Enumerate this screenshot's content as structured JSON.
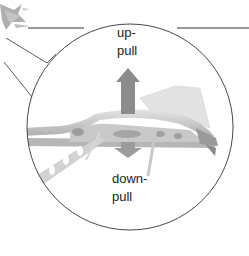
{
  "diagram": {
    "labels": {
      "up_line1": "up-",
      "up_line2": "pull",
      "down_line1": "down-",
      "down_line2": "pull"
    },
    "icons": {
      "plane": "airplane-thumbnail-icon",
      "up_arrow": "arrow-up-icon",
      "down_arrow": "arrow-down-icon"
    },
    "colors": {
      "outline": "#333333",
      "arrow": "#8a8a8a",
      "wing_light": "#d8d8d8",
      "wing_mid": "#b0b0b0",
      "wing_dark": "#8c8c8c",
      "background": "#ffffff"
    }
  }
}
